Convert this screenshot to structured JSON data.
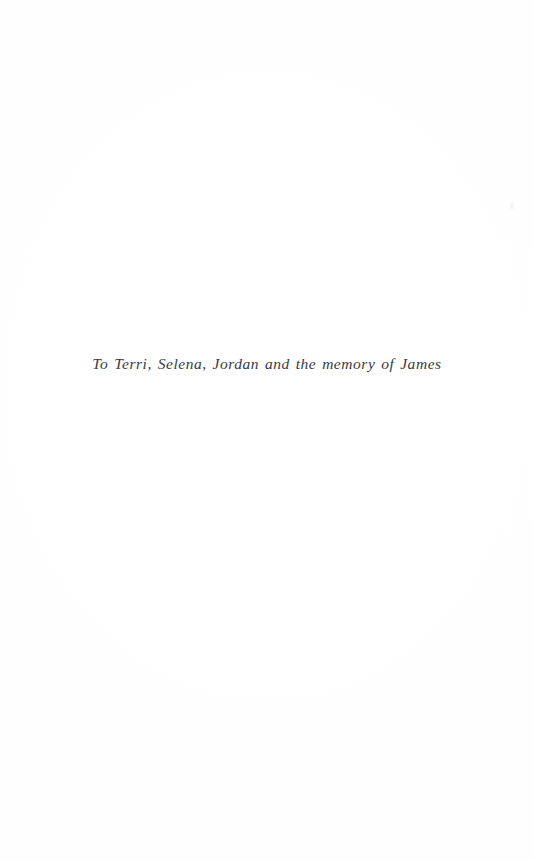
{
  "page": {
    "kind": "book-dedication-page",
    "background_color": "#fefefe",
    "width_px": 534,
    "height_px": 861
  },
  "dedication": {
    "text": "To Terri, Selena, Jordan and the memory of James",
    "ink_color": "#2a2a2e",
    "alignment": "center",
    "style": "italic"
  },
  "artifacts": {
    "speckle_label": ""
  }
}
